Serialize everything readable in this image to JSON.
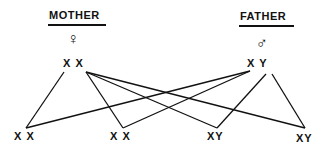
{
  "parents": {
    "mother": {
      "label": "MOTHER",
      "symbol": "♀",
      "chromosomes": "X X"
    },
    "father": {
      "label": "FATHER",
      "symbol": "♂",
      "chromosomes": "X Y"
    }
  },
  "offspring": [
    {
      "chromosomes": "X X"
    },
    {
      "chromosomes": "X X"
    },
    {
      "chromosomes": "XY"
    },
    {
      "chromosomes": "XY"
    }
  ]
}
